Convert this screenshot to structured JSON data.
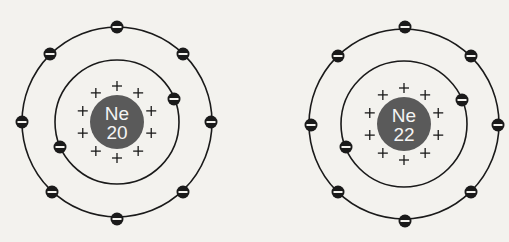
{
  "diagram": {
    "type": "bohr-model-comparison",
    "atoms": [
      {
        "id": "neon-20",
        "symbol": "Ne",
        "mass_number": "20",
        "center": [
          117,
          122
        ],
        "nucleus_radius": 27,
        "proton_count": 10,
        "shells": [
          {
            "radius": 62,
            "electrons": [
              [
                174,
                99
              ],
              [
                60,
                147
              ]
            ]
          },
          {
            "radius": 95,
            "electrons": [
              [
                117,
                27
              ],
              [
                50,
                54
              ],
              [
                183,
                54
              ],
              [
                22,
                122
              ],
              [
                211,
                122
              ],
              [
                52,
                192
              ],
              [
                183,
                192
              ],
              [
                117,
                219
              ]
            ]
          }
        ]
      },
      {
        "id": "neon-22",
        "symbol": "Ne",
        "mass_number": "22",
        "center": [
          404,
          124
        ],
        "nucleus_radius": 27,
        "proton_count": 10,
        "shells": [
          {
            "radius": 63,
            "electrons": [
              [
                462,
                100
              ],
              [
                346,
                147
              ]
            ]
          },
          {
            "radius": 95,
            "electrons": [
              [
                405,
                27
              ],
              [
                338,
                56
              ],
              [
                471,
                56
              ],
              [
                311,
                125
              ],
              [
                498,
                125
              ],
              [
                338,
                192
              ],
              [
                471,
                192
              ],
              [
                405,
                221
              ]
            ]
          }
        ]
      }
    ],
    "symbols": {
      "proton": "+",
      "electron": "minus-in-circle"
    },
    "colors": {
      "background": "#f3f2ee",
      "line": "#1a1a1a",
      "nucleus": "#5a5a5a",
      "nucleus_text": "#f4f4f4"
    }
  }
}
